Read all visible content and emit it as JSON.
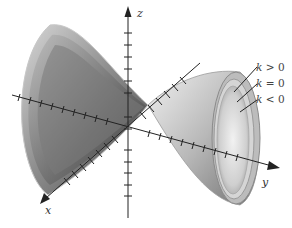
{
  "figure": {
    "axes": {
      "x_label": "x",
      "y_label": "y",
      "z_label": "z"
    },
    "legend": [
      {
        "var": "k",
        "rel": ">",
        "val": "0"
      },
      {
        "var": "k",
        "rel": "=",
        "val": "0"
      },
      {
        "var": "k",
        "rel": "<",
        "val": "0"
      }
    ],
    "colors": {
      "axis": "#222222",
      "surface_light": "#e8e8e8",
      "surface_mid": "#a8a8a8",
      "surface_dark": "#5a5a5a"
    }
  }
}
